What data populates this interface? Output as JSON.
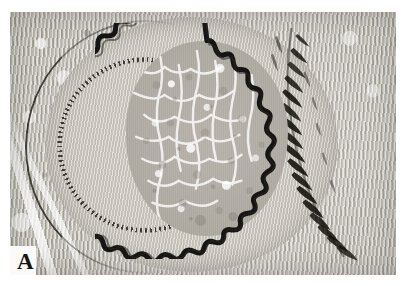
{
  "figure": {
    "panel_label": "A",
    "caption_text": "",
    "modality": "light-microscopy-histology",
    "staining": "elastic-van-gieson-grayscale",
    "specimen": "artery cross-section"
  },
  "plate": {
    "width_px": 386,
    "height_px": 263,
    "offset_x_px": 10,
    "offset_y_px": 12,
    "background_color": "#ffffff"
  },
  "palette": {
    "page_background": "#ffffff",
    "tissue_light": "#d2cec6",
    "tissue_mid": "#b9b5ae",
    "tissue_dark": "#a39e95",
    "lumen_fill": "#b6b2aa",
    "media_fill": "#cbc7bf",
    "elastic_lamina": "#141210",
    "label_color": "#141414"
  },
  "structures": [
    {
      "name": "lumen",
      "label": "Lumen",
      "description": "Central vessel lumen filled with mottled granular material"
    },
    {
      "name": "internal-elastic-lamina",
      "label": "Internal elastic lamina",
      "description": "Bold black crenated (wavy) ring encircling the lumen"
    },
    {
      "name": "tunica-media",
      "label": "Tunica media",
      "description": "Pale concentric smooth-muscle ring outside the internal elastic lamina"
    },
    {
      "name": "external-elastic-lamina",
      "label": "External elastic lamina",
      "description": "Dark stippled and streaky elastic fibre band at the outer media border"
    },
    {
      "name": "adventitia",
      "label": "Tunica adventitia",
      "description": "Outer fibrous connective tissue with pale clefts, surrounding the vessel"
    }
  ]
}
